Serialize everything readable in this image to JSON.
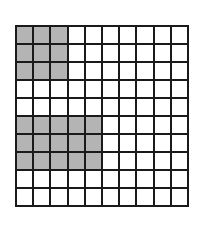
{
  "grid": {
    "rows": 10,
    "cols": 10,
    "shade_color": "#b4b4b4",
    "line_color": "#1a1a1a",
    "shaded_regions": [
      {
        "rows": [
          0,
          2
        ],
        "cols": [
          0,
          2
        ],
        "count": 9
      },
      {
        "rows": [
          5,
          7
        ],
        "cols": [
          0,
          4
        ],
        "count": 15
      }
    ],
    "shaded_total": 24,
    "total_cells": 100
  }
}
